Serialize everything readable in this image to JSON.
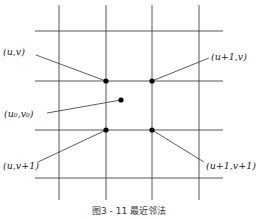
{
  "diagram": {
    "type": "grid-interpolation",
    "grid": {
      "vertical_lines_x": [
        59,
        106,
        152,
        199
      ],
      "horizontal_lines_y": [
        31,
        81,
        130,
        178
      ],
      "x_span": [
        35,
        223
      ],
      "y_span": [
        5,
        200
      ],
      "line_color": "#444444"
    },
    "points": [
      {
        "id": "p_uv",
        "label": "(u,v)",
        "x": 106,
        "y": 81,
        "label_x": 3,
        "label_y": 55,
        "anchor_x": 36,
        "anchor_y": 55
      },
      {
        "id": "p_u1v",
        "label": "(u+1,v)",
        "x": 152,
        "y": 81,
        "label_x": 211,
        "label_y": 60,
        "anchor_x": 209,
        "anchor_y": 58
      },
      {
        "id": "p_u0v0",
        "label": "(u₀,v₀)",
        "x": 121,
        "y": 100,
        "label_x": 4,
        "label_y": 117,
        "anchor_x": 47,
        "anchor_y": 113
      },
      {
        "id": "p_uv1",
        "label": "(u,v+1)",
        "x": 106,
        "y": 130,
        "label_x": 3,
        "label_y": 169,
        "anchor_x": 38,
        "anchor_y": 162
      },
      {
        "id": "p_u1v1",
        "label": "(u+1,v+1)",
        "x": 152,
        "y": 130,
        "label_x": 206,
        "label_y": 169,
        "anchor_x": 204,
        "anchor_y": 162
      }
    ],
    "caption": "图3 - 11   最近邻法"
  }
}
